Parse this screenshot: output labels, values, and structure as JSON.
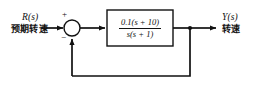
{
  "diagram": {
    "type": "control-system-block-diagram",
    "canvas": {
      "width": 259,
      "height": 86
    },
    "colors": {
      "background": "#ffffff",
      "line": "#111111",
      "block_border": "#111111",
      "block_fill": "#ffffff",
      "text": "#111111"
    },
    "input": {
      "symbol": "R(s)",
      "caption": "预期转速"
    },
    "output": {
      "symbol": "Y(s)",
      "caption": "转速"
    },
    "summing_junction": {
      "name": "summing-junction",
      "shape": "circle",
      "plus_sign": "+",
      "minus_sign": "−",
      "plus_input": "reference",
      "minus_input": "feedback"
    },
    "plant_block": {
      "name": "transfer-function-block",
      "transfer_function": "0.1(s + 10) / (s(s + 1))",
      "numerator": "0.1(s + 10)",
      "denominator": "s(s + 1)",
      "gain": 0.1,
      "zeros": [
        -10
      ],
      "poles": [
        0,
        -1
      ]
    },
    "feedback": {
      "name": "feedback-path",
      "type": "unity",
      "gain": 1,
      "sign": "negative"
    }
  }
}
